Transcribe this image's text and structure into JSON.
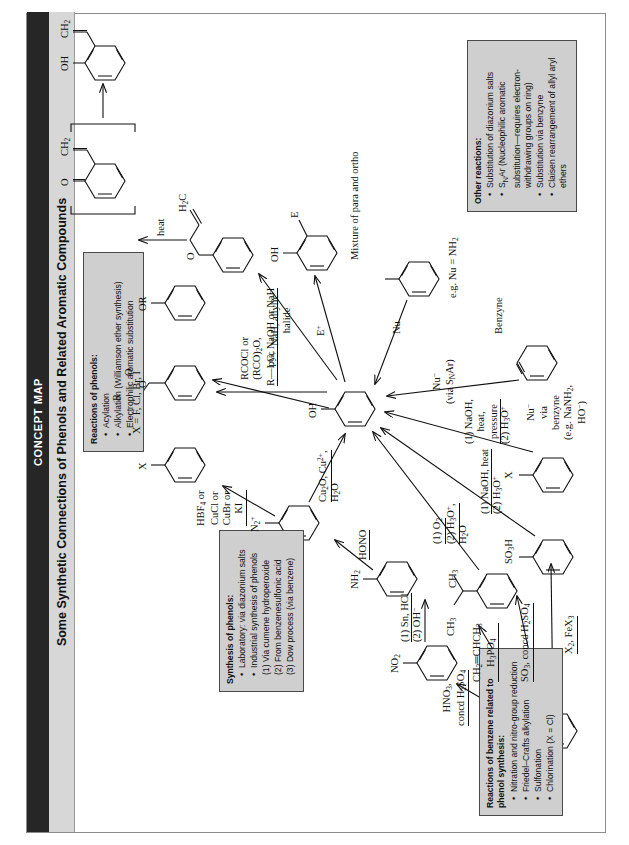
{
  "header": {
    "kicker": "CONCEPT MAP",
    "title": "Some Synthetic Connections of Phenols and Related Aromatic Compounds"
  },
  "boxes": [
    {
      "id": "reactions-of-benzene",
      "title": "Reactions of benzene related to phenol synthesis:",
      "items": [
        "Nitration and nitro-group reduction",
        "Friedel–Crafts alkylation",
        "Sulfonation",
        "Chlorination (X = Cl)"
      ]
    },
    {
      "id": "synthesis-of-phenols",
      "title": "Synthesis of phenols:",
      "items": [
        "Laboratory: via diazonium salts",
        "Industrial synthesis of phenols"
      ],
      "sub": [
        "(1) Via cumene hydroperoxide",
        "(2) From benzenesulfonic acid",
        "(3) Dow process (via benzene)"
      ]
    },
    {
      "id": "reactions-of-phenols",
      "title": "Reactions of phenols:",
      "items": [
        "Acylation",
        "Alkylation (Williamson ether synthesis)",
        "Electrophilic aromatic substitution"
      ]
    },
    {
      "id": "other-reactions",
      "title": "Other reactions:",
      "items": [
        "Substitution of diazonium salts",
        "S<sub>N</sub>Ar (Nucleophilic aromatic substitution—requires electron-withdrawing groups on ring)",
        "Substitution via benzyne",
        "Claisen rearrangement of allyl aryl ethers"
      ]
    }
  ],
  "labels": {
    "benzene_to_nitro": "HNO<sub>3</sub>,<br>concd H<sub>2</sub>SO<sub>4</sub>",
    "benzene_to_cumene": "CH<sub>2</sub>═CHCH<sub>3</sub><br>H<sub>3</sub>PO<sub>4</sub>",
    "benzene_to_sulfonic": "SO<sub>3</sub>, concd H<sub>2</sub>SO<sub>4</sub>",
    "benzene_to_halide": "X<sub>2</sub>, FeX<sub>3</sub>",
    "nitro_sub": "NO<sub>2</sub>",
    "nitro_to_amine_1": "(1) Sn, HCl",
    "nitro_to_amine_2": "(2) OH<sup>−</sup>",
    "amine_sub": "NH<sub>2</sub>",
    "amine_to_diazo": "HONO",
    "diazo_sub": "N<sub>2</sub><sup>+</sup>",
    "diazo_to_halide": "HBF<sub>4</sub> or<br>CuCl or<br>CuBr or<br>KI",
    "halide_sub": "X",
    "halide_note": "X = F, Cl, Br, I",
    "diazo_to_phenol_1": "Cu<sub>2</sub>O, Cu<sup>2+</sup>,",
    "diazo_to_phenol_2": "H<sub>2</sub>O",
    "cumene_sub": "CH<sub>3</sub>",
    "cumene_side": "CH<sub>3</sub>",
    "cumene_to_phenol_1": "(1) O<sub>2</sub>",
    "cumene_to_phenol_2": "(2) H<sub>3</sub>O<sup>+</sup>,",
    "cumene_to_phenol_3": "H<sub>2</sub>O",
    "sulfonic_sub": "SO<sub>3</sub>H",
    "sulfonic_to_phenol_1": "(1) NaOH, heat",
    "sulfonic_to_phenol_2": "(2) H<sub>3</sub>O<sup>+</sup>",
    "halide_to_phenol_1": "(1) NaOH,<br>heat,<br>pressure",
    "halide_to_phenol_2": "(2) H<sub>3</sub>O<sup>+</sup>",
    "phenol_sub": "OH",
    "phenol_acylation": "RCOCl or<br>(RCO)<sub>2</sub>O,<br>pyr.",
    "ester_r": "R",
    "ester_o": "O",
    "ester_dbl_o": "O",
    "phenol_alkylation": "R—LG, NaOH or NaH",
    "ether_sub": "OR",
    "phenol_allyl": "NaH, allylic<br>halide",
    "allyl_ether_o": "O",
    "allyl_ether_ch2": "H<sub>2</sub>C",
    "claisen_heat": "heat",
    "dienone_o": "O",
    "dienone_ch2": "CH<sub>2</sub>",
    "ortho_allyl_oh": "OH",
    "ortho_allyl_ch2": "CH<sub>2</sub>",
    "eas_label": "E<sup>+</sup>",
    "eas_sub_oh": "OH",
    "eas_sub_e": "E",
    "eas_note": "Mixture of para and ortho",
    "nu_arrow": "Nu",
    "nu_note": "e.g. Nu = NH<sub>2</sub>",
    "snar_label": "Nu<sup>−</sup><br>(via S<sub>N</sub>Ar)",
    "benzyne_label": "Nu<sup>−</sup><br>via<br>benzyne<br>(e.g. NaNH<sub>2</sub>,<br>HO<sup>−</sup>)",
    "benzyne_name": "Benzyne",
    "x_sub": "X"
  }
}
